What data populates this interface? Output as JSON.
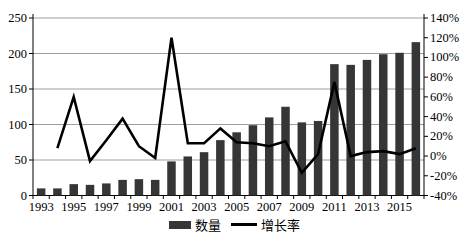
{
  "chart_data": {
    "type": "bar",
    "subtype": "combo-bar-line-dual-axis",
    "title": "",
    "categories": [
      "1993",
      "1994",
      "1995",
      "1996",
      "1997",
      "1998",
      "1999",
      "2000",
      "2001",
      "2002",
      "2003",
      "2004",
      "2005",
      "2006",
      "2007",
      "2008",
      "2009",
      "2010",
      "2011",
      "2012",
      "2013",
      "2014",
      "2015",
      "2016"
    ],
    "series": [
      {
        "name": "数量",
        "type": "bar",
        "axis": "left",
        "values": [
          10,
          10,
          16,
          15,
          17,
          22,
          23,
          22,
          48,
          55,
          61,
          78,
          89,
          99,
          110,
          125,
          103,
          105,
          185,
          184,
          191,
          199,
          201,
          216
        ]
      },
      {
        "name": "增长率",
        "type": "line",
        "axis": "right",
        "unit": "%",
        "values": [
          null,
          8,
          60,
          -5,
          16,
          38,
          10,
          -2,
          120,
          13,
          13,
          28,
          14,
          13,
          10,
          15,
          -17,
          2,
          75,
          0,
          4,
          5,
          2,
          8
        ]
      }
    ],
    "left_axis": {
      "min": 0,
      "max": 250,
      "step": 50,
      "tick_labels": [
        "0",
        "50",
        "100",
        "150",
        "200",
        "250"
      ]
    },
    "right_axis": {
      "min": -40,
      "max": 140,
      "step": 20,
      "tick_labels": [
        "-40%",
        "-20%",
        "0%",
        "20%",
        "40%",
        "60%",
        "80%",
        "100%",
        "120%",
        "140%"
      ]
    },
    "x_tick_labels": [
      "1993",
      "1995",
      "1997",
      "1999",
      "2001",
      "2003",
      "2005",
      "2007",
      "2009",
      "2011",
      "2013",
      "2015"
    ],
    "x_label_every": 2,
    "grid": true,
    "legend_position": "bottom-center",
    "legend": [
      {
        "label": "数量",
        "marker": "bar-swatch"
      },
      {
        "label": "增长率",
        "marker": "line-swatch"
      }
    ]
  },
  "style": {
    "bar_color": "#363636",
    "line_color": "#000000",
    "grid_color": "#9e9e9e",
    "axis_color": "#000000",
    "text_color": "#000000",
    "background": "#ffffff"
  }
}
